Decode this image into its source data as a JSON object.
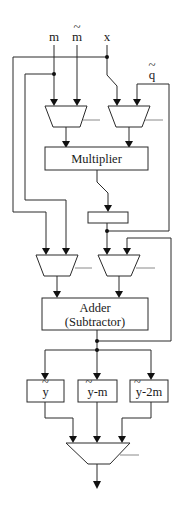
{
  "diagram": {
    "type": "hardware-datapath",
    "inputs": {
      "m": "m",
      "m_tilde": "m",
      "x": "x",
      "q_tilde": "q"
    },
    "blocks": {
      "multiplier": "Multiplier",
      "adder_line1": "Adder",
      "adder_line2": "(Subtractor)",
      "reg_y": "y",
      "reg_y_minus_m": "y-m",
      "reg_y_minus_2m": "y-2m"
    },
    "tilde": "~",
    "colors": {
      "line": "#2a2a2a",
      "control_line": "#8a8a8a",
      "background": "#ffffff"
    }
  }
}
